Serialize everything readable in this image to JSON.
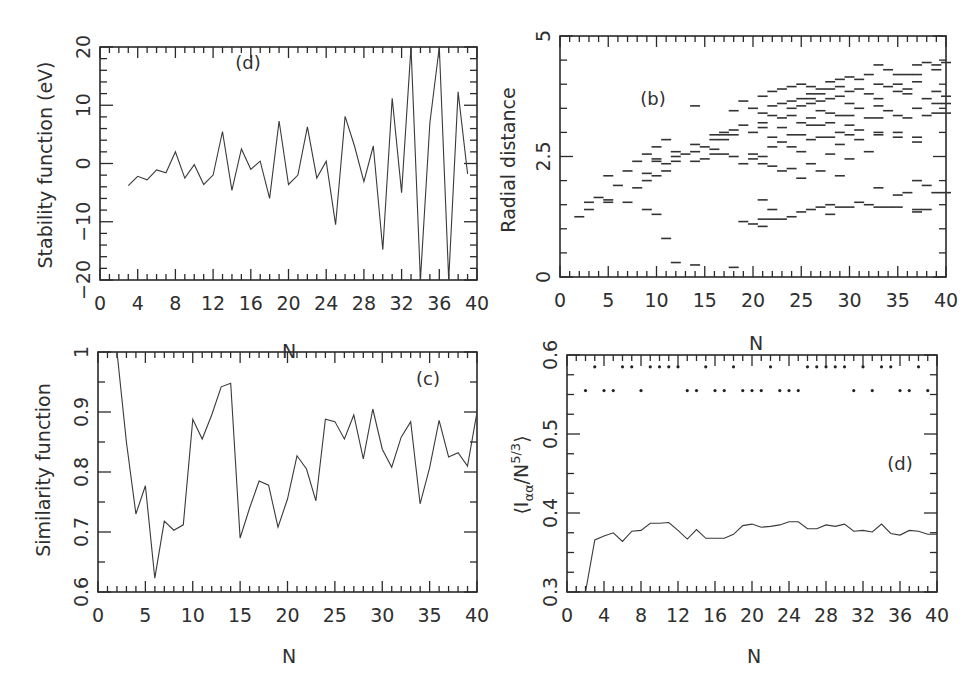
{
  "figure": {
    "panels": [
      "top-left",
      "top-right",
      "bottom-left",
      "bottom-right"
    ]
  },
  "chart_data": [
    {
      "id": "stability",
      "type": "line",
      "panel_label": "(d)",
      "xlabel": "N",
      "ylabel": "Stability function (eV)",
      "xlim": [
        0,
        40
      ],
      "ylim": [
        -20,
        20
      ],
      "xticks": [
        0,
        4,
        8,
        12,
        16,
        20,
        24,
        28,
        32,
        36,
        40
      ],
      "yticks": [
        -20,
        -10,
        0,
        10,
        20
      ],
      "grid": false,
      "x": [
        3,
        4,
        5,
        6,
        7,
        8,
        9,
        10,
        11,
        12,
        13,
        14,
        15,
        16,
        17,
        18,
        19,
        20,
        21,
        22,
        23,
        24,
        25,
        26,
        27,
        28,
        29,
        30,
        31,
        32,
        33,
        34,
        35,
        36,
        37,
        38,
        39
      ],
      "y": [
        -3.8,
        -2.2,
        -2.8,
        -1.1,
        -1.6,
        2.0,
        -2.5,
        -0.2,
        -3.6,
        -2.0,
        5.5,
        -4.6,
        2.5,
        -1.0,
        0.4,
        -6.0,
        7.3,
        -3.6,
        -2.0,
        6.3,
        -2.5,
        0.4,
        -10.5,
        8.1,
        3.0,
        -3.1,
        3.0,
        -14.8,
        11.2,
        -5.0,
        20,
        -20,
        7.0,
        20,
        -20,
        12.3,
        -1.8
      ]
    },
    {
      "id": "radial",
      "type": "scatter",
      "marker": "horizontal-dash",
      "panel_label": "(b)",
      "xlabel": "N",
      "ylabel": "Radial distance",
      "xlim": [
        0,
        40
      ],
      "ylim": [
        0,
        5
      ],
      "xticks": [
        0,
        5,
        10,
        15,
        20,
        25,
        30,
        35,
        40
      ],
      "yticks": [
        0,
        2.5,
        5
      ],
      "grid": false,
      "points": [
        [
          2,
          1.25
        ],
        [
          3,
          1.4
        ],
        [
          3,
          1.55
        ],
        [
          4,
          1.65
        ],
        [
          5,
          1.6
        ],
        [
          5,
          1.55
        ],
        [
          5,
          2.1
        ],
        [
          6,
          1.9
        ],
        [
          7,
          1.55
        ],
        [
          7,
          2.2
        ],
        [
          8,
          1.85
        ],
        [
          8,
          2.4
        ],
        [
          9,
          2.15
        ],
        [
          9,
          2.0
        ],
        [
          9,
          2.55
        ],
        [
          9,
          1.4
        ],
        [
          10,
          2.4
        ],
        [
          10,
          2.1
        ],
        [
          10,
          2.7
        ],
        [
          10,
          2.45
        ],
        [
          10,
          1.3
        ],
        [
          11,
          2.85
        ],
        [
          11,
          2.35
        ],
        [
          11,
          2.2
        ],
        [
          11,
          0.8
        ],
        [
          12,
          2.6
        ],
        [
          12,
          2.5
        ],
        [
          12,
          2.4
        ],
        [
          12,
          0.3
        ],
        [
          13,
          2.55
        ],
        [
          14,
          2.75
        ],
        [
          14,
          2.6
        ],
        [
          14,
          3.55
        ],
        [
          14,
          2.4
        ],
        [
          14,
          0.25
        ],
        [
          15,
          2.7
        ],
        [
          15,
          2.45
        ],
        [
          16,
          2.65
        ],
        [
          16,
          2.85
        ],
        [
          16,
          2.95
        ],
        [
          16,
          2.55
        ],
        [
          17,
          2.95
        ],
        [
          17,
          2.85
        ],
        [
          17,
          3.0
        ],
        [
          17,
          2.55
        ],
        [
          18,
          3.05
        ],
        [
          18,
          2.95
        ],
        [
          18,
          2.5
        ],
        [
          18,
          3.45
        ],
        [
          18,
          0.2
        ],
        [
          19,
          3.65
        ],
        [
          19,
          3.15
        ],
        [
          19,
          2.35
        ],
        [
          19,
          1.15
        ],
        [
          20,
          3.5
        ],
        [
          20,
          3.0
        ],
        [
          20,
          2.55
        ],
        [
          20,
          2.45
        ],
        [
          20,
          1.1
        ],
        [
          21,
          3.75
        ],
        [
          21,
          3.4
        ],
        [
          21,
          3.2
        ],
        [
          21,
          3.1
        ],
        [
          21,
          2.5
        ],
        [
          21,
          2.35
        ],
        [
          21,
          1.2
        ],
        [
          21,
          1.05
        ],
        [
          21,
          1.6
        ],
        [
          22,
          3.85
        ],
        [
          22,
          3.55
        ],
        [
          22,
          3.35
        ],
        [
          22,
          2.9
        ],
        [
          22,
          2.7
        ],
        [
          22,
          2.3
        ],
        [
          22,
          1.4
        ],
        [
          22,
          1.2
        ],
        [
          23,
          3.9
        ],
        [
          23,
          3.6
        ],
        [
          23,
          3.3
        ],
        [
          23,
          3.1
        ],
        [
          23,
          2.8
        ],
        [
          23,
          2.2
        ],
        [
          23,
          1.2
        ],
        [
          24,
          3.95
        ],
        [
          24,
          3.65
        ],
        [
          24,
          3.5
        ],
        [
          24,
          3.35
        ],
        [
          24,
          2.95
        ],
        [
          24,
          2.7
        ],
        [
          24,
          2.25
        ],
        [
          24,
          1.25
        ],
        [
          25,
          4.0
        ],
        [
          25,
          3.7
        ],
        [
          25,
          3.55
        ],
        [
          25,
          3.2
        ],
        [
          25,
          2.95
        ],
        [
          25,
          2.6
        ],
        [
          25,
          2.05
        ],
        [
          25,
          1.35
        ],
        [
          26,
          3.95
        ],
        [
          26,
          3.8
        ],
        [
          26,
          3.7
        ],
        [
          26,
          3.6
        ],
        [
          26,
          3.3
        ],
        [
          26,
          3.15
        ],
        [
          26,
          2.85
        ],
        [
          26,
          2.35
        ],
        [
          26,
          1.4
        ],
        [
          27,
          3.9
        ],
        [
          27,
          3.8
        ],
        [
          27,
          3.65
        ],
        [
          27,
          3.45
        ],
        [
          27,
          3.15
        ],
        [
          27,
          2.9
        ],
        [
          27,
          2.2
        ],
        [
          27,
          1.45
        ],
        [
          28,
          4.05
        ],
        [
          28,
          3.9
        ],
        [
          28,
          3.7
        ],
        [
          28,
          3.4
        ],
        [
          28,
          3.2
        ],
        [
          28,
          2.9
        ],
        [
          28,
          2.55
        ],
        [
          28,
          1.5
        ],
        [
          28,
          1.3
        ],
        [
          29,
          4.1
        ],
        [
          29,
          3.95
        ],
        [
          29,
          3.75
        ],
        [
          29,
          3.35
        ],
        [
          29,
          3.0
        ],
        [
          29,
          2.75
        ],
        [
          29,
          2.1
        ],
        [
          29,
          1.45
        ],
        [
          30,
          4.15
        ],
        [
          30,
          3.85
        ],
        [
          30,
          3.6
        ],
        [
          30,
          3.35
        ],
        [
          30,
          3.15
        ],
        [
          30,
          2.95
        ],
        [
          30,
          2.45
        ],
        [
          30,
          1.45
        ],
        [
          31,
          4.1
        ],
        [
          31,
          3.9
        ],
        [
          31,
          3.5
        ],
        [
          31,
          3.05
        ],
        [
          31,
          2.85
        ],
        [
          31,
          1.55
        ],
        [
          32,
          4.2
        ],
        [
          32,
          3.8
        ],
        [
          32,
          3.3
        ],
        [
          32,
          2.6
        ],
        [
          32,
          1.5
        ],
        [
          33,
          4.4
        ],
        [
          33,
          4.0
        ],
        [
          33,
          3.7
        ],
        [
          33,
          3.55
        ],
        [
          33,
          3.3
        ],
        [
          33,
          3.0
        ],
        [
          33,
          2.95
        ],
        [
          33,
          1.85
        ],
        [
          33,
          1.45
        ],
        [
          34,
          4.3
        ],
        [
          34,
          3.95
        ],
        [
          34,
          3.45
        ],
        [
          34,
          1.45
        ],
        [
          35,
          4.2
        ],
        [
          35,
          4.0
        ],
        [
          35,
          3.85
        ],
        [
          35,
          3.35
        ],
        [
          35,
          3.0
        ],
        [
          35,
          2.9
        ],
        [
          35,
          1.7
        ],
        [
          35,
          1.45
        ],
        [
          36,
          4.2
        ],
        [
          36,
          3.9
        ],
        [
          36,
          3.8
        ],
        [
          36,
          3.3
        ],
        [
          36,
          1.75
        ],
        [
          37,
          4.4
        ],
        [
          37,
          4.2
        ],
        [
          37,
          4.05
        ],
        [
          37,
          3.5
        ],
        [
          37,
          2.9
        ],
        [
          37,
          2.8
        ],
        [
          37,
          2.0
        ],
        [
          37,
          1.4
        ],
        [
          37,
          1.35
        ],
        [
          38,
          4.45
        ],
        [
          38,
          3.7
        ],
        [
          38,
          3.35
        ],
        [
          38,
          1.9
        ],
        [
          38,
          1.4
        ],
        [
          39,
          4.4
        ],
        [
          39,
          4.3
        ],
        [
          39,
          3.85
        ],
        [
          39,
          3.6
        ],
        [
          39,
          3.4
        ],
        [
          39,
          1.75
        ],
        [
          40,
          4.45
        ],
        [
          40,
          3.75
        ],
        [
          40,
          3.6
        ],
        [
          40,
          3.4
        ],
        [
          40,
          1.75
        ]
      ]
    },
    {
      "id": "similarity",
      "type": "line",
      "panel_label": "(c)",
      "xlabel": "N",
      "ylabel": "Similarity function",
      "xlim": [
        0,
        40
      ],
      "ylim": [
        0.6,
        1.0
      ],
      "xticks": [
        0,
        5,
        10,
        15,
        20,
        25,
        30,
        35,
        40
      ],
      "yticks": [
        0.6,
        0.7,
        0.8,
        0.9,
        1
      ],
      "ytick_labels": [
        "0.6",
        "0.7",
        "0.8",
        "0.9",
        "1"
      ],
      "grid": false,
      "x": [
        2,
        3,
        4,
        5,
        6,
        7,
        8,
        9,
        10,
        11,
        12,
        13,
        14,
        15,
        16,
        17,
        18,
        19,
        20,
        21,
        22,
        23,
        24,
        25,
        26,
        27,
        28,
        29,
        30,
        31,
        32,
        33,
        34,
        35,
        36,
        37,
        38,
        39,
        40
      ],
      "y": [
        1.0,
        0.85,
        0.73,
        0.777,
        0.623,
        0.718,
        0.703,
        0.712,
        0.888,
        0.855,
        0.895,
        0.942,
        0.948,
        0.69,
        0.74,
        0.785,
        0.778,
        0.708,
        0.755,
        0.827,
        0.805,
        0.752,
        0.888,
        0.884,
        0.855,
        0.895,
        0.822,
        0.905,
        0.838,
        0.808,
        0.858,
        0.884,
        0.747,
        0.807,
        0.886,
        0.825,
        0.832,
        0.81,
        0.9
      ]
    },
    {
      "id": "inertia",
      "type": "line",
      "panel_label": "(d)",
      "xlabel": "N",
      "ylabel": "⟨I_αα/N^{5/3}⟩",
      "xlim": [
        0,
        40
      ],
      "ylim": [
        0.3,
        0.6
      ],
      "xticks": [
        0,
        4,
        8,
        12,
        16,
        20,
        24,
        28,
        32,
        36,
        40
      ],
      "yticks": [
        0.3,
        0.4,
        0.5,
        0.6
      ],
      "grid": false,
      "x": [
        2,
        3,
        4,
        5,
        6,
        7,
        8,
        9,
        10,
        11,
        12,
        13,
        14,
        15,
        16,
        17,
        18,
        19,
        20,
        21,
        22,
        23,
        24,
        25,
        26,
        27,
        28,
        29,
        30,
        31,
        32,
        33,
        34,
        35,
        36,
        37,
        38,
        39,
        40
      ],
      "y": [
        0.3,
        0.366,
        0.371,
        0.375,
        0.364,
        0.377,
        0.378,
        0.387,
        0.387,
        0.388,
        0.378,
        0.367,
        0.379,
        0.368,
        0.368,
        0.368,
        0.373,
        0.384,
        0.386,
        0.382,
        0.383,
        0.385,
        0.389,
        0.389,
        0.38,
        0.38,
        0.385,
        0.383,
        0.386,
        0.377,
        0.378,
        0.376,
        0.386,
        0.374,
        0.372,
        0.378,
        0.377,
        0.373,
        0.373
      ],
      "marker_rows": {
        "row_upper_y": 0.585,
        "row_upper_x": [
          3,
          6,
          7,
          9,
          10,
          11,
          12,
          15,
          18,
          22,
          26,
          27,
          28,
          29,
          30,
          32,
          34,
          35,
          38
        ],
        "row_lower_y": 0.555,
        "row_lower_x": [
          2,
          4,
          5,
          8,
          13,
          14,
          16,
          17,
          19,
          20,
          21,
          23,
          24,
          25,
          31,
          33,
          36,
          37,
          39
        ]
      }
    }
  ],
  "labels": {
    "tl": {
      "panel": "(d)",
      "ylabel": "Stability function (eV)",
      "xlabel": "N"
    },
    "tr": {
      "panel": "(b)",
      "ylabel": "Radial distance",
      "xlabel": "N"
    },
    "bl": {
      "panel": "(c)",
      "ylabel": "Similarity function",
      "xlabel": "N"
    },
    "br": {
      "panel": "(d)",
      "ylabel_main": "⟨I",
      "ylabel_sub": "αα",
      "ylabel_mid": "/N",
      "ylabel_sup": "5/3",
      "ylabel_end": "⟩",
      "xlabel": "N"
    }
  }
}
